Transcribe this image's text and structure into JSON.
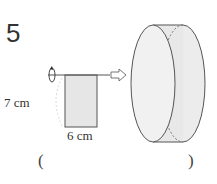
{
  "problem": {
    "number": "5"
  },
  "figure": {
    "height_label": "7 cm",
    "width_label": "6 cm",
    "rotation_icon": "rotation-arrow-icon",
    "arrow_icon": "hollow-right-arrow-icon",
    "colors": {
      "fill": "#e6e6e6",
      "stroke": "#555555"
    }
  },
  "answer": {
    "open_paren": "(",
    "close_paren": ")",
    "value": ""
  }
}
